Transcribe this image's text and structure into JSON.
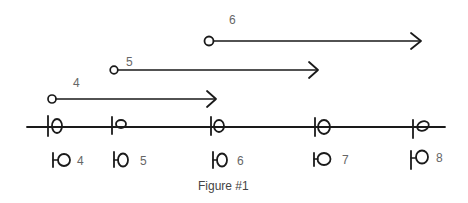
{
  "figure": {
    "caption": "Figure #1",
    "arrows": [
      {
        "label": "4",
        "start_symbol": "open-circle",
        "end_symbol": "arrowhead"
      },
      {
        "label": "5",
        "start_symbol": "open-circle",
        "end_symbol": "arrowhead"
      },
      {
        "label": "6",
        "start_symbol": "open-circle",
        "end_symbol": "arrowhead"
      }
    ],
    "timeline": {
      "ticks": [
        {
          "glyph": "tick-with-loop"
        },
        {
          "glyph": "tick-with-small-loop"
        },
        {
          "glyph": "tick-with-loop"
        },
        {
          "glyph": "tick-with-loop"
        },
        {
          "glyph": "tick-with-slanted-loop"
        }
      ]
    },
    "legend_glyphs": [
      {
        "label": "4",
        "glyph": "lollipop-symbol"
      },
      {
        "label": "5",
        "glyph": "lollipop-symbol"
      },
      {
        "label": "6",
        "glyph": "lollipop-symbol"
      },
      {
        "label": "7",
        "glyph": "lollipop-symbol"
      },
      {
        "label": "8",
        "glyph": "lollipop-symbol"
      }
    ]
  }
}
